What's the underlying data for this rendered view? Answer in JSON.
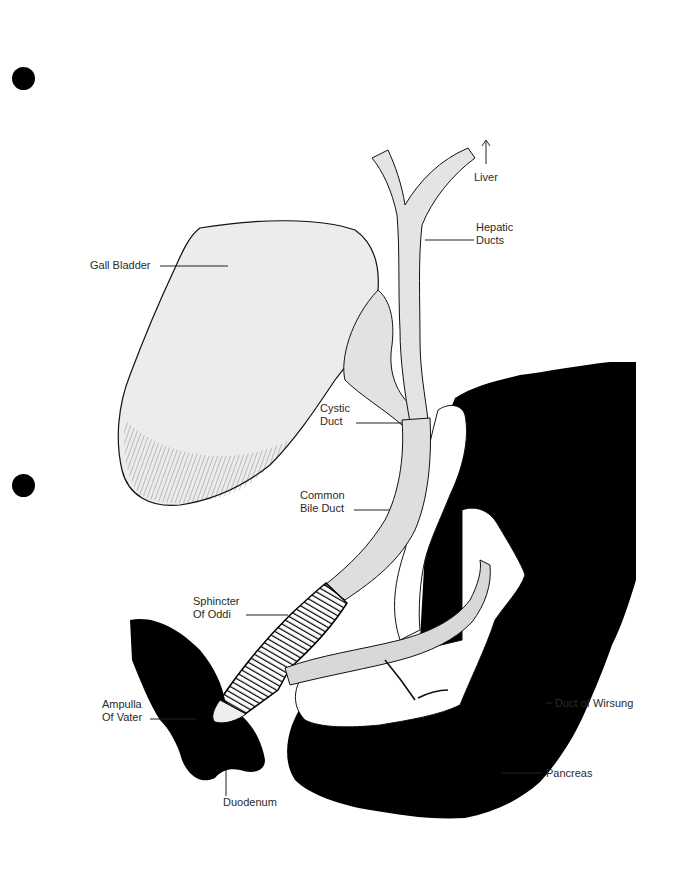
{
  "figure": {
    "type": "anatomical-illustration",
    "colors": {
      "background": "#ffffff",
      "organ_fill": "#e8e8e8",
      "duct_fill": "#dcdcdc",
      "solid_organ": "#000000",
      "outline": "#1a1a1a",
      "label_text": "#2a2a2a"
    }
  },
  "labels": {
    "liver": "Liver",
    "hepatic_ducts": "Hepatic\nDucts",
    "gall_bladder": "Gall Bladder",
    "cystic_duct": "Cystic\nDuct",
    "common_bile_duct": "Common\nBile Duct",
    "sphincter_of_oddi": "Sphincter\nOf Oddi",
    "ampulla_of_vater": "Ampulla\nOf Vater",
    "duodenum": "Duodenum",
    "duct_of_wirsung": "Duct of Wirsung",
    "pancreas": "Pancreas"
  },
  "binder_holes": 2
}
